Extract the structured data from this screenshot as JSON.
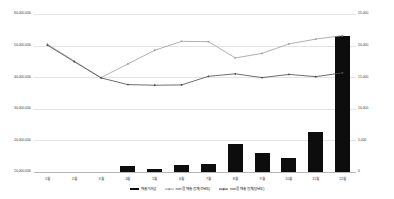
{
  "chart_data": {
    "type": "bar",
    "title": "",
    "xlabel": "",
    "ylabel": "",
    "grid": true,
    "legend_position": "bottom",
    "categories": [
      "1월",
      "2월",
      "3월",
      "4월",
      "5월",
      "6월",
      "7월",
      "8월",
      "9월",
      "10월",
      "11월",
      "12월"
    ],
    "axes": {
      "left": {
        "ticks": [
          "60,000,000",
          "50,000,000",
          "40,000,000",
          "30,000,000",
          "20,000,000",
          "10,000,000"
        ],
        "values": [
          60000000,
          50000000,
          40000000,
          30000000,
          20000000,
          10000000
        ],
        "min": 10000000,
        "max": 60000000
      },
      "right": {
        "ticks": [
          "25,000",
          "20,000",
          "15,000",
          "10,000",
          "5,000",
          "0"
        ],
        "values": [
          25000,
          20000,
          15000,
          10000,
          5000,
          0
        ],
        "min": 0,
        "max": 25000
      }
    },
    "series": [
      {
        "name": "매출기여금",
        "type": "bar",
        "axis": "right",
        "color": "#0d0d0d",
        "values": [
          0,
          0,
          0,
          1100,
          700,
          1300,
          1400,
          4600,
          3100,
          2300,
          6500,
          21500
        ]
      },
      {
        "name": "non몰 매출 합계(전년도)",
        "type": "line",
        "axis": "left",
        "color": "#9c9c9c",
        "values": [
          50500000,
          45200000,
          40000000,
          44300000,
          48600000,
          51400000,
          51300000,
          46200000,
          47600000,
          50600000,
          52100000,
          53200000
        ]
      },
      {
        "name": "non몰 매출 합계(당년도)",
        "type": "line",
        "axis": "left",
        "color": "#4a4a4a",
        "values": [
          50200000,
          45000000,
          39900000,
          37800000,
          37600000,
          37700000,
          40400000,
          41200000,
          40000000,
          41000000,
          40300000,
          41500000
        ]
      }
    ]
  },
  "legend": {
    "items": [
      {
        "label": "매출기여금",
        "marker": "bar"
      },
      {
        "label": "non몰 매출 합계(전년도)",
        "marker": "line-gray"
      },
      {
        "label": "non몰 매출 합계(당년도)",
        "marker": "line-dark"
      }
    ]
  }
}
